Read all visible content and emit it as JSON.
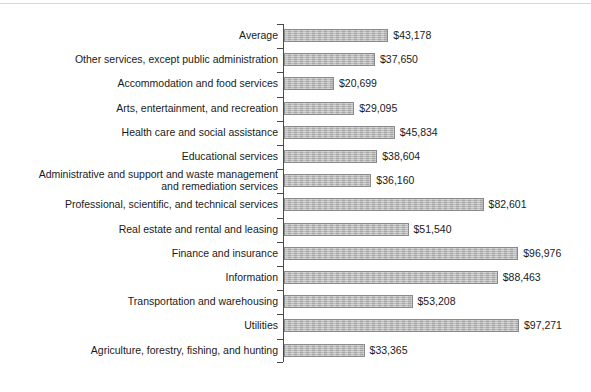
{
  "chart_data": {
    "type": "bar",
    "orientation": "horizontal",
    "title": "",
    "subtitle": "",
    "xlabel": "",
    "ylabel": "",
    "grid": false,
    "legend": null,
    "xlim": [
      0,
      97271
    ],
    "value_prefix": "$",
    "axis_line_visible": true,
    "tick_marks": "between categories",
    "bar_color": "#b4b4b4",
    "bar_border_color": "#8a8a8a",
    "text_color": "#1a1a1a",
    "categories": [
      "Average",
      "Other services, except public administration",
      "Accommodation and food services",
      "Arts, entertainment, and recreation",
      "Health care and social assistance",
      "Educational services",
      "Administrative and support and waste management\nand remediation services",
      "Professional, scientific, and technical services",
      "Real estate and rental and leasing",
      "Finance and insurance",
      "Information",
      "Transportation and warehousing",
      "Utilities",
      "Agriculture, forestry, fishing, and hunting"
    ],
    "values": [
      43178,
      37650,
      20699,
      29095,
      45834,
      38604,
      36160,
      82601,
      51540,
      96976,
      88463,
      53208,
      97271,
      33365
    ],
    "value_labels": [
      "$43,178",
      "$37,650",
      "$20,699",
      "$29,095",
      "$45,834",
      "$38,604",
      "$36,160",
      "$82,601",
      "$51,540",
      "$96,976",
      "$88,463",
      "$53,208",
      "$97,271",
      "$33,365"
    ]
  }
}
